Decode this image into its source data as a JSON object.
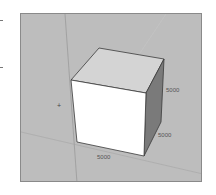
{
  "viewport": {
    "background": "#bdbdbd",
    "cube": {
      "front_face": "#ffffff",
      "top_face": "#d4d4d4",
      "side_face": "#7a7a7a",
      "edge": "#3a3a3a"
    },
    "origin_marker": "+"
  },
  "dimensions": {
    "height_label": "5000",
    "depth_label": "5000",
    "width_label": "5000"
  }
}
